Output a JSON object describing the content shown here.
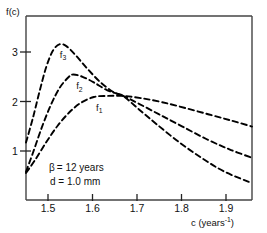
{
  "chart_data": {
    "type": "line",
    "title": "",
    "subtitle": "",
    "xlabel": "c (years⁻¹)",
    "ylabel": "f(c)",
    "xlim": [
      1.45,
      1.95
    ],
    "ylim": [
      0.45,
      3.72
    ],
    "grid": false,
    "legend_position": "inline-curve-labels",
    "linestyle": "dashed",
    "color": "#000000",
    "xticks": [
      1.5,
      1.6,
      1.7,
      1.8,
      1.9
    ],
    "xticklabels": [
      "1.5",
      "1.6",
      "1.7",
      "1.8",
      "1.9"
    ],
    "yticks": [
      1,
      2,
      3
    ],
    "yticklabels": [
      "1",
      "2",
      "3"
    ],
    "annotations": [
      {
        "text": "β = 12 years",
        "x": 1.5,
        "y": 1.1
      },
      {
        "text": "d = 1.0 mm",
        "x": 1.5,
        "y": 0.92
      }
    ],
    "crossing_point": {
      "x": 1.665,
      "y": 2.3
    },
    "series": [
      {
        "name": "f₃",
        "label": "f3",
        "label_x": 1.532,
        "label_y": 2.98,
        "peak": {
          "x": 1.525,
          "y": 3.22
        },
        "x": [
          1.45,
          1.465,
          1.48,
          1.495,
          1.51,
          1.525,
          1.54,
          1.56,
          1.585,
          1.615,
          1.645,
          1.665,
          1.7,
          1.74,
          1.79,
          1.84,
          1.89,
          1.95
        ],
        "y": [
          1.47,
          1.9,
          2.38,
          2.82,
          3.11,
          3.22,
          3.18,
          3.02,
          2.79,
          2.54,
          2.36,
          2.3,
          2.06,
          1.79,
          1.47,
          1.19,
          0.95,
          0.75
        ]
      },
      {
        "name": "f₂",
        "label": "f2",
        "label_x": 1.568,
        "label_y": 2.42,
        "peak": {
          "x": 1.555,
          "y": 2.68
        },
        "x": [
          1.45,
          1.465,
          1.485,
          1.505,
          1.525,
          1.545,
          1.555,
          1.575,
          1.6,
          1.63,
          1.665,
          1.7,
          1.745,
          1.795,
          1.85,
          1.9,
          1.95
        ],
        "y": [
          0.95,
          1.28,
          1.74,
          2.14,
          2.45,
          2.64,
          2.68,
          2.64,
          2.54,
          2.4,
          2.3,
          2.16,
          1.97,
          1.76,
          1.53,
          1.35,
          1.2
        ]
      },
      {
        "name": "f₁",
        "label": "f1",
        "label_x": 1.612,
        "label_y": 2.04,
        "peak": {
          "x": 1.605,
          "y": 2.29
        },
        "x": [
          1.45,
          1.47,
          1.495,
          1.52,
          1.545,
          1.57,
          1.6,
          1.63,
          1.665,
          1.705,
          1.75,
          1.8,
          1.855,
          1.905,
          1.95
        ],
        "y": [
          0.93,
          1.16,
          1.48,
          1.77,
          2.0,
          2.17,
          2.28,
          2.3,
          2.3,
          2.26,
          2.19,
          2.09,
          1.97,
          1.86,
          1.755
        ]
      }
    ]
  },
  "axes": {
    "y_axis_label": "f(c)",
    "x_axis_label_base": "c (years",
    "x_axis_label_exp": "-1",
    "x_axis_label_close": ")"
  },
  "annotations": {
    "beta_symbol": "β",
    "beta_value": "= 12 years",
    "d_line": "d = 1.0 mm"
  }
}
